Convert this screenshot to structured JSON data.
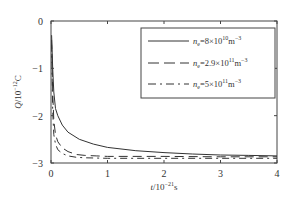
{
  "chart_data": {
    "type": "line",
    "title": "",
    "xlabel": "t/10^-21 s",
    "ylabel": "Q/10^-12 C",
    "xlim": [
      0,
      4
    ],
    "ylim": [
      -3,
      0
    ],
    "xticks": [
      0,
      1,
      2,
      3,
      4
    ],
    "yticks": [
      0,
      -1,
      -2,
      -3
    ],
    "grid": false,
    "legend_position": "upper right",
    "series": [
      {
        "name": "n_e=8×10^10 m^-3",
        "style": "solid",
        "x": [
          0.01,
          0.03,
          0.05,
          0.08,
          0.12,
          0.2,
          0.3,
          0.5,
          0.75,
          1.0,
          1.5,
          2.0,
          2.5,
          3.0,
          3.5,
          4.0
        ],
        "y": [
          -0.3,
          -1.0,
          -1.5,
          -1.85,
          -2.0,
          -2.2,
          -2.35,
          -2.5,
          -2.6,
          -2.67,
          -2.74,
          -2.78,
          -2.81,
          -2.83,
          -2.84,
          -2.85
        ]
      },
      {
        "name": "n_e=2.9×10^11 m^-3",
        "style": "dashed",
        "x": [
          0.01,
          0.03,
          0.05,
          0.08,
          0.12,
          0.2,
          0.3,
          0.45,
          0.6,
          0.8,
          1.0,
          2.0,
          3.0,
          4.0
        ],
        "y": [
          -0.4,
          -1.5,
          -2.1,
          -2.4,
          -2.55,
          -2.68,
          -2.76,
          -2.82,
          -2.84,
          -2.85,
          -2.86,
          -2.86,
          -2.87,
          -2.87
        ]
      },
      {
        "name": "n_e=5×10^11 m^-3",
        "style": "dashdot",
        "x": [
          0.01,
          0.03,
          0.05,
          0.08,
          0.12,
          0.2,
          0.3,
          0.45,
          0.6,
          1.0,
          2.0,
          3.0,
          4.0
        ],
        "y": [
          -0.5,
          -1.9,
          -2.4,
          -2.6,
          -2.72,
          -2.8,
          -2.85,
          -2.88,
          -2.89,
          -2.9,
          -2.9,
          -2.9,
          -2.9
        ]
      }
    ]
  },
  "labels": {
    "xlabel_main": "t",
    "xlabel_rest": "/10",
    "xlabel_exp": "−21",
    "xlabel_unit": "s",
    "ylabel_main": "Q",
    "ylabel_rest": "/10",
    "ylabel_exp": "−12",
    "ylabel_unit": "C",
    "xticks": [
      "0",
      "1",
      "2",
      "3",
      "4"
    ],
    "yticks": [
      "0",
      "−1",
      "−2",
      "−3"
    ]
  },
  "legend": [
    {
      "sym": "n",
      "sub": "e",
      "eq": "=8×10",
      "exp": "10",
      "unit": "m",
      "unit_exp": "−3"
    },
    {
      "sym": "n",
      "sub": "e",
      "eq": "=2.9×10",
      "exp": "11",
      "unit": "m",
      "unit_exp": "−3"
    },
    {
      "sym": "n",
      "sub": "e",
      "eq": "=5×10",
      "exp": "11",
      "unit": "m",
      "unit_exp": "−3"
    }
  ]
}
